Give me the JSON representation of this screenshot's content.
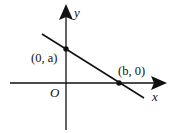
{
  "diagram": {
    "type": "coordinate-plane-line",
    "axes": {
      "x_label": "x",
      "y_label": "y",
      "origin_label": "O"
    },
    "points": [
      {
        "label": "(0, a)",
        "description": "y-intercept"
      },
      {
        "label": "(b, 0)",
        "description": "x-intercept"
      }
    ],
    "line": {
      "slope_sign": "negative",
      "passes_through": [
        "(0, a)",
        "(b, 0)"
      ]
    },
    "colors": {
      "stroke": "#111111",
      "background": "#ffffff"
    }
  }
}
